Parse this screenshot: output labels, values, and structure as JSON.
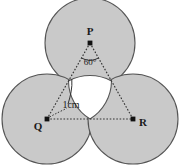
{
  "figure": {
    "width": 180,
    "height": 166,
    "background_color": "#ffffff",
    "circle_fill_color": "#c9c9c9",
    "circle_stroke_color": "#555555",
    "line_color": "#333333",
    "text_color": "#1a1a1a",
    "radius_px": 45
  },
  "vertices": [
    {
      "id": "P",
      "label": "P",
      "cx": 90,
      "cy": 43,
      "label_x": 90,
      "label_y": 33
    },
    {
      "id": "Q",
      "label": "Q",
      "cx": 47,
      "cy": 119,
      "label_x": 38,
      "label_y": 129
    },
    {
      "id": "R",
      "label": "R",
      "cx": 133,
      "cy": 119,
      "label_x": 143,
      "label_y": 126
    }
  ],
  "annotations": {
    "angle": {
      "label": "60°",
      "vertex": "P",
      "x": 90,
      "y": 62,
      "value_degrees": 60
    },
    "measure": {
      "label": "1cm",
      "x": 71,
      "y": 106,
      "value": 1,
      "unit": "cm",
      "describes": "radius of each circle"
    }
  },
  "geometry": {
    "shape": "equilateral-triangle",
    "side_label": "2cm",
    "circle_count": 3,
    "tangency": "mutually tangent"
  }
}
